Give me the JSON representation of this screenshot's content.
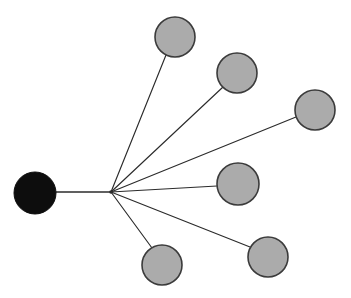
{
  "diagram": {
    "type": "star-graph",
    "canvas": {
      "width": 351,
      "height": 298,
      "background": "#ffffff"
    },
    "colors": {
      "background": "#ffffff",
      "leaf_fill": "#ababab",
      "leaf_stroke": "#3b3b3b",
      "center_fill": "#0d0d0d",
      "edge_stroke": "#2b2b2b"
    },
    "junction": {
      "name": "edge-junction",
      "cx": 111,
      "cy": 192
    },
    "nodes": [
      {
        "id": "center-node",
        "label": "",
        "cx": 35,
        "cy": 193,
        "r": 21,
        "fill": "#0d0d0d",
        "role": "center"
      },
      {
        "id": "leaf-node-top",
        "label": "",
        "cx": 175,
        "cy": 37,
        "r": 20,
        "fill": "#ababab",
        "role": "leaf"
      },
      {
        "id": "leaf-node-upper-right",
        "label": "",
        "cx": 237,
        "cy": 73,
        "r": 20,
        "fill": "#ababab",
        "role": "leaf"
      },
      {
        "id": "leaf-node-far-right",
        "label": "",
        "cx": 315,
        "cy": 110,
        "r": 20,
        "fill": "#ababab",
        "role": "leaf"
      },
      {
        "id": "leaf-node-middle-right",
        "label": "",
        "cx": 238,
        "cy": 184,
        "r": 21,
        "fill": "#ababab",
        "role": "leaf"
      },
      {
        "id": "leaf-node-lower-right",
        "label": "",
        "cx": 268,
        "cy": 257,
        "r": 20,
        "fill": "#ababab",
        "role": "leaf"
      },
      {
        "id": "leaf-node-bottom",
        "label": "",
        "cx": 162,
        "cy": 265,
        "r": 20,
        "fill": "#ababab",
        "role": "leaf"
      }
    ],
    "edges": [
      {
        "id": "edge-center-to-junction",
        "from": "center-node",
        "to": "edge-junction",
        "x1": 56,
        "y1": 192,
        "x2": 111,
        "y2": 192,
        "trunk": true
      },
      {
        "id": "edge-junction-to-top",
        "from": "edge-junction",
        "to": "leaf-node-top",
        "x1": 111,
        "y1": 192,
        "x2": 166,
        "y2": 55,
        "trunk": false
      },
      {
        "id": "edge-junction-to-upper-right",
        "from": "edge-junction",
        "to": "leaf-node-upper-right",
        "x1": 111,
        "y1": 192,
        "x2": 223,
        "y2": 87,
        "trunk": false
      },
      {
        "id": "edge-junction-to-far-right",
        "from": "edge-junction",
        "to": "leaf-node-far-right",
        "x1": 111,
        "y1": 192,
        "x2": 296,
        "y2": 117,
        "trunk": false
      },
      {
        "id": "edge-junction-to-middle-right",
        "from": "edge-junction",
        "to": "leaf-node-middle-right",
        "x1": 111,
        "y1": 192,
        "x2": 217,
        "y2": 186,
        "trunk": false
      },
      {
        "id": "edge-junction-to-lower-right",
        "from": "edge-junction",
        "to": "leaf-node-lower-right",
        "x1": 111,
        "y1": 192,
        "x2": 250,
        "y2": 247,
        "trunk": false
      },
      {
        "id": "edge-junction-to-bottom",
        "from": "edge-junction",
        "to": "leaf-node-bottom",
        "x1": 111,
        "y1": 192,
        "x2": 152,
        "y2": 248,
        "trunk": false
      }
    ]
  }
}
